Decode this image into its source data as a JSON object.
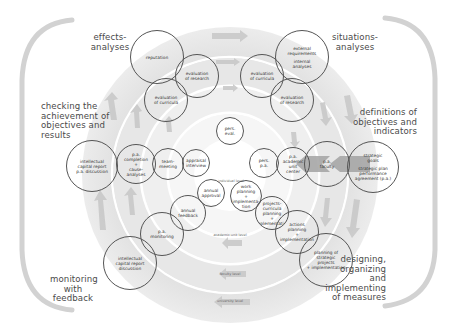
{
  "diagram": {
    "type": "concentric-cycle",
    "center": {
      "x": 230,
      "y": 175
    },
    "colors": {
      "ring_outer": "#dcdcdc",
      "ring_mid_outer": "#e6e6e6",
      "ring_mid": "#eeeeee",
      "ring_inner": "#f4f4f4",
      "core": "#ffffff",
      "separator": "#ffffff",
      "bubble_stroke": "#555555",
      "arrow": "#c4c4c4",
      "highlight_arrow": "#9a9a9a",
      "bracket": "#d0d0d0",
      "text": "#4a4a4a"
    },
    "levels": [
      {
        "label": "individual level"
      },
      {
        "label": "academic unit level"
      },
      {
        "label": "faculty level"
      },
      {
        "label": "university level"
      }
    ],
    "phases": {
      "effects": "effects-\nanalyses",
      "situations": "situations-\nanalyses",
      "checking": "checking the\nachievement of\nobjectives and\nresults",
      "definitions": "definitions of\nobjectives and\nindicators",
      "monitoring": "monitoring\nwith\nfeedback",
      "designing": "designing,\norganizing\nand\nimplementing\nof measures"
    },
    "bubbles": [
      {
        "id": "reputation",
        "lines": [
          "reputation"
        ]
      },
      {
        "id": "eval-research-left",
        "lines": [
          "evaluation",
          "of research"
        ]
      },
      {
        "id": "eval-curricula-left",
        "lines": [
          "evaluation",
          "of curricula"
        ]
      },
      {
        "id": "external-internal",
        "lines": [
          "external",
          "requirements",
          "",
          "internal",
          "analyses"
        ]
      },
      {
        "id": "eval-curricula-right",
        "lines": [
          "evaluation",
          "of curricula"
        ]
      },
      {
        "id": "eval-research-right",
        "lines": [
          "evaluation",
          "of research"
        ]
      },
      {
        "id": "pers-eval",
        "lines": [
          "pers.",
          "eval."
        ]
      },
      {
        "id": "icr-pa-discussion",
        "lines": [
          "intellectual",
          "capital report",
          "p.a. discussion"
        ]
      },
      {
        "id": "pa-completion",
        "lines": [
          "p.a.",
          "completion",
          "+",
          "cause-",
          "analyses"
        ]
      },
      {
        "id": "team-meeting",
        "lines": [
          "team-",
          "meeting"
        ]
      },
      {
        "id": "appraisal-interview",
        "lines": [
          "appraisal",
          "interview"
        ]
      },
      {
        "id": "pers-pa",
        "lines": [
          "pers.",
          "p.a."
        ]
      },
      {
        "id": "pa-academic-unit",
        "lines": [
          "p.a.",
          "academic",
          "unit",
          "center"
        ]
      },
      {
        "id": "pa-faculty",
        "lines": [
          "p.a.",
          "faculty"
        ]
      },
      {
        "id": "strategic-goals",
        "lines": [
          "strategic",
          "goals",
          "",
          "strategic plan",
          "performance",
          "agreement (p.a.)"
        ]
      },
      {
        "id": "annual-approval",
        "lines": [
          "annual",
          "approval"
        ]
      },
      {
        "id": "work-planning",
        "lines": [
          "work",
          "planning",
          "+",
          "implementa-",
          "tion"
        ]
      },
      {
        "id": "projects-curricula",
        "lines": [
          "projects-",
          "curricula",
          "planning",
          "+",
          "implementation"
        ]
      },
      {
        "id": "annual-feedback",
        "lines": [
          "annual",
          "feedback"
        ]
      },
      {
        "id": "actions-planning",
        "lines": [
          "actions",
          "planning",
          "+",
          "implementation"
        ]
      },
      {
        "id": "pa-monitoring",
        "lines": [
          "p.a.",
          "monitoring"
        ]
      },
      {
        "id": "icr-discussion",
        "lines": [
          "intellectual",
          "capital report",
          "discussion"
        ]
      },
      {
        "id": "planning-strategic-projects",
        "lines": [
          "planning of",
          "strategic",
          "projects",
          "+ implementation"
        ]
      }
    ]
  }
}
